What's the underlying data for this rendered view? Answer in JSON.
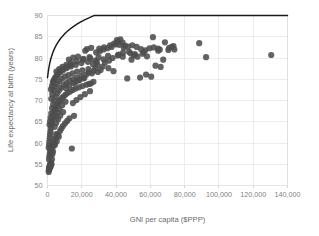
{
  "chart_data": {
    "type": "scatter",
    "title": "",
    "subtitle": "",
    "xlabel": "GNI per capita ($PPP)",
    "ylabel": "Life expectancy at birth (years)",
    "xlim": [
      0,
      140000
    ],
    "ylim": [
      50,
      90
    ],
    "grid": true,
    "legend": "none",
    "xticks": [
      0,
      20000,
      40000,
      60000,
      80000,
      100000,
      120000,
      140000
    ],
    "xtick_labels": [
      "0",
      "20,000",
      "40,000",
      "60,000",
      "80,000",
      "100,000",
      "120,000",
      "140,000"
    ],
    "yticks": [
      50,
      55,
      60,
      65,
      70,
      75,
      80,
      85,
      90
    ],
    "ytick_labels": [
      "50",
      "55",
      "60",
      "65",
      "70",
      "75",
      "80",
      "85",
      "90"
    ],
    "marker": {
      "shape": "circle",
      "size_px": 3.1,
      "color": "#4d4d4d",
      "opacity": 0.88
    },
    "series": [
      {
        "name": "Countries",
        "points": [
          [
            700,
            53.2
          ],
          [
            820,
            53.6
          ],
          [
            900,
            54.0
          ],
          [
            1000,
            54.3
          ],
          [
            1150,
            53.9
          ],
          [
            1250,
            54.6
          ],
          [
            1400,
            54.2
          ],
          [
            1550,
            54.8
          ],
          [
            1700,
            55.1
          ],
          [
            1900,
            54.5
          ],
          [
            2100,
            55.4
          ],
          [
            2350,
            55.0
          ],
          [
            2600,
            56.2
          ],
          [
            2900,
            57.4
          ],
          [
            3200,
            58.0
          ],
          [
            3600,
            59.3
          ],
          [
            4000,
            60.1
          ],
          [
            4400,
            59.6
          ],
          [
            4900,
            61.2
          ],
          [
            5400,
            60.4
          ],
          [
            6000,
            62.0
          ],
          [
            6600,
            61.5
          ],
          [
            7300,
            62.8
          ],
          [
            8100,
            63.4
          ],
          [
            9000,
            64.0
          ],
          [
            10200,
            64.6
          ],
          [
            11500,
            65.2
          ],
          [
            12800,
            65.8
          ],
          [
            14200,
            58.7
          ],
          [
            15500,
            66.4
          ],
          [
            700,
            58.9
          ],
          [
            900,
            59.6
          ],
          [
            1100,
            60.4
          ],
          [
            1300,
            61.2
          ],
          [
            1500,
            62.0
          ],
          [
            1700,
            62.7
          ],
          [
            1900,
            63.4
          ],
          [
            2100,
            64.1
          ],
          [
            2400,
            64.8
          ],
          [
            2700,
            65.4
          ],
          [
            3000,
            66.0
          ],
          [
            3400,
            66.6
          ],
          [
            3800,
            67.2
          ],
          [
            4300,
            67.8
          ],
          [
            4800,
            68.3
          ],
          [
            5400,
            68.8
          ],
          [
            6100,
            69.3
          ],
          [
            6800,
            69.8
          ],
          [
            7600,
            70.2
          ],
          [
            8500,
            70.6
          ],
          [
            9500,
            71.0
          ],
          [
            10600,
            71.4
          ],
          [
            11800,
            71.8
          ],
          [
            13200,
            72.1
          ],
          [
            14700,
            72.5
          ],
          [
            16400,
            72.8
          ],
          [
            18300,
            73.1
          ],
          [
            20400,
            73.4
          ],
          [
            22700,
            73.7
          ],
          [
            25300,
            74.0
          ],
          [
            1200,
            64.3
          ],
          [
            1500,
            65.1
          ],
          [
            1800,
            66.0
          ],
          [
            2200,
            67.0
          ],
          [
            2700,
            68.2
          ],
          [
            3300,
            69.1
          ],
          [
            4000,
            70.0
          ],
          [
            4800,
            70.9
          ],
          [
            5700,
            71.7
          ],
          [
            6800,
            72.4
          ],
          [
            8000,
            73.0
          ],
          [
            9400,
            73.6
          ],
          [
            11000,
            74.1
          ],
          [
            12800,
            74.6
          ],
          [
            14900,
            75.0
          ],
          [
            17200,
            75.4
          ],
          [
            19800,
            75.8
          ],
          [
            22700,
            76.1
          ],
          [
            25900,
            76.4
          ],
          [
            29400,
            76.7
          ],
          [
            2200,
            70.4
          ],
          [
            2800,
            71.5
          ],
          [
            3500,
            72.4
          ],
          [
            4400,
            73.2
          ],
          [
            5500,
            73.9
          ],
          [
            6800,
            74.5
          ],
          [
            8300,
            75.1
          ],
          [
            10100,
            75.6
          ],
          [
            12200,
            76.0
          ],
          [
            14600,
            76.4
          ],
          [
            17300,
            76.8
          ],
          [
            20400,
            77.1
          ],
          [
            23900,
            77.4
          ],
          [
            27800,
            77.7
          ],
          [
            32100,
            78.0
          ],
          [
            3500,
            74.6
          ],
          [
            4500,
            75.3
          ],
          [
            5700,
            76.0
          ],
          [
            7200,
            76.6
          ],
          [
            9000,
            77.1
          ],
          [
            11100,
            77.6
          ],
          [
            13600,
            78.0
          ],
          [
            16500,
            78.4
          ],
          [
            19800,
            78.8
          ],
          [
            23600,
            79.1
          ],
          [
            27900,
            79.4
          ],
          [
            32700,
            79.7
          ],
          [
            38000,
            80.0
          ],
          [
            43900,
            80.3
          ],
          [
            50400,
            80.6
          ],
          [
            5200,
            76.8
          ],
          [
            6800,
            77.4
          ],
          [
            8700,
            77.9
          ],
          [
            11000,
            78.4
          ],
          [
            13700,
            78.8
          ],
          [
            16900,
            79.2
          ],
          [
            20600,
            79.6
          ],
          [
            24900,
            79.9
          ],
          [
            29800,
            80.2
          ],
          [
            35300,
            80.5
          ],
          [
            41500,
            80.8
          ],
          [
            48400,
            81.1
          ],
          [
            56100,
            81.4
          ],
          [
            64600,
            81.7
          ],
          [
            74000,
            82.0
          ],
          [
            12500,
            79.6
          ],
          [
            15000,
            80.1
          ],
          [
            17800,
            80.3
          ],
          [
            21000,
            79.8
          ],
          [
            24500,
            80.2
          ],
          [
            28400,
            81.3
          ],
          [
            30500,
            81.6
          ],
          [
            32700,
            82.0
          ],
          [
            35000,
            82.3
          ],
          [
            37400,
            82.6
          ],
          [
            39900,
            83.2
          ],
          [
            41200,
            83.9
          ],
          [
            42500,
            84.4
          ],
          [
            43800,
            83.6
          ],
          [
            45200,
            82.9
          ],
          [
            30200,
            82.2
          ],
          [
            33000,
            82.5
          ],
          [
            36500,
            83.0
          ],
          [
            38800,
            83.4
          ],
          [
            40500,
            84.2
          ],
          [
            42000,
            83.1
          ],
          [
            44500,
            82.4
          ],
          [
            47000,
            82.7
          ],
          [
            49500,
            83.0
          ],
          [
            52000,
            82.6
          ],
          [
            54500,
            82.1
          ],
          [
            57000,
            81.8
          ],
          [
            59500,
            82.3
          ],
          [
            62000,
            82.5
          ],
          [
            64500,
            82.2
          ],
          [
            31000,
            77.2
          ],
          [
            35500,
            77.6
          ],
          [
            38500,
            76.9
          ],
          [
            41000,
            80.6
          ],
          [
            44000,
            81.2
          ],
          [
            47500,
            81.5
          ],
          [
            51000,
            80.9
          ],
          [
            54000,
            75.4
          ],
          [
            57500,
            76.1
          ],
          [
            60500,
            75.6
          ],
          [
            63000,
            78.2
          ],
          [
            66000,
            77.9
          ],
          [
            68500,
            83.7
          ],
          [
            71000,
            82.4
          ],
          [
            73500,
            82.8
          ],
          [
            46500,
            75.2
          ],
          [
            49000,
            79.6
          ],
          [
            52500,
            80.3
          ],
          [
            55500,
            81.0
          ],
          [
            58000,
            80.4
          ],
          [
            61500,
            84.9
          ],
          [
            65500,
            82.0
          ],
          [
            67500,
            79.6
          ],
          [
            70500,
            81.9
          ],
          [
            72500,
            82.6
          ],
          [
            88500,
            83.5
          ],
          [
            92500,
            80.2
          ],
          [
            130500,
            80.7
          ],
          [
            2000,
            72.6
          ],
          [
            2600,
            73.4
          ],
          [
            3100,
            74.2
          ],
          [
            3900,
            74.9
          ],
          [
            4700,
            75.5
          ],
          [
            5900,
            76.2
          ],
          [
            7400,
            76.9
          ],
          [
            9200,
            77.4
          ],
          [
            11400,
            78.0
          ],
          [
            13900,
            78.3
          ],
          [
            16200,
            74.3
          ],
          [
            18600,
            74.8
          ],
          [
            21500,
            75.3
          ],
          [
            24200,
            73.9
          ],
          [
            26800,
            74.4
          ],
          [
            5000,
            66.2
          ],
          [
            5800,
            67.1
          ],
          [
            7000,
            68.0
          ],
          [
            8600,
            68.9
          ],
          [
            10500,
            69.7
          ],
          [
            4200,
            63.8
          ],
          [
            5100,
            64.7
          ],
          [
            6200,
            65.6
          ],
          [
            7500,
            66.5
          ],
          [
            9100,
            67.3
          ],
          [
            1800,
            57.2
          ],
          [
            2300,
            58.4
          ],
          [
            3000,
            59.7
          ],
          [
            3900,
            60.9
          ],
          [
            5000,
            62.1
          ],
          [
            900,
            56.1
          ],
          [
            1050,
            56.8
          ],
          [
            1350,
            57.6
          ],
          [
            1650,
            58.3
          ],
          [
            2050,
            59.1
          ],
          [
            14800,
            69.4
          ],
          [
            16900,
            70.1
          ],
          [
            19200,
            70.8
          ],
          [
            21800,
            71.5
          ],
          [
            24800,
            72.2
          ],
          [
            10800,
            72.9
          ],
          [
            12600,
            73.5
          ],
          [
            15200,
            74.1
          ],
          [
            17900,
            74.7
          ],
          [
            20900,
            75.2
          ],
          [
            24000,
            76.6
          ],
          [
            27000,
            77.0
          ],
          [
            29000,
            78.4
          ],
          [
            33500,
            78.9
          ],
          [
            36000,
            79.4
          ],
          [
            23000,
            82.1
          ],
          [
            25500,
            82.4
          ],
          [
            22000,
            81.7
          ],
          [
            26500,
            78.6
          ],
          [
            28800,
            79.1
          ]
        ]
      }
    ],
    "trendline": {
      "present": true,
      "type": "logarithmic",
      "color": "#1a1a1a",
      "description": "Logarithmic best-fit curve rising steeply from about 60 years near 0 GNI to about 86 years at 140,000 GNI"
    }
  },
  "axes": {
    "x_title": "GNI per capita ($PPP)",
    "y_title": "Life expectancy at birth (years)"
  }
}
